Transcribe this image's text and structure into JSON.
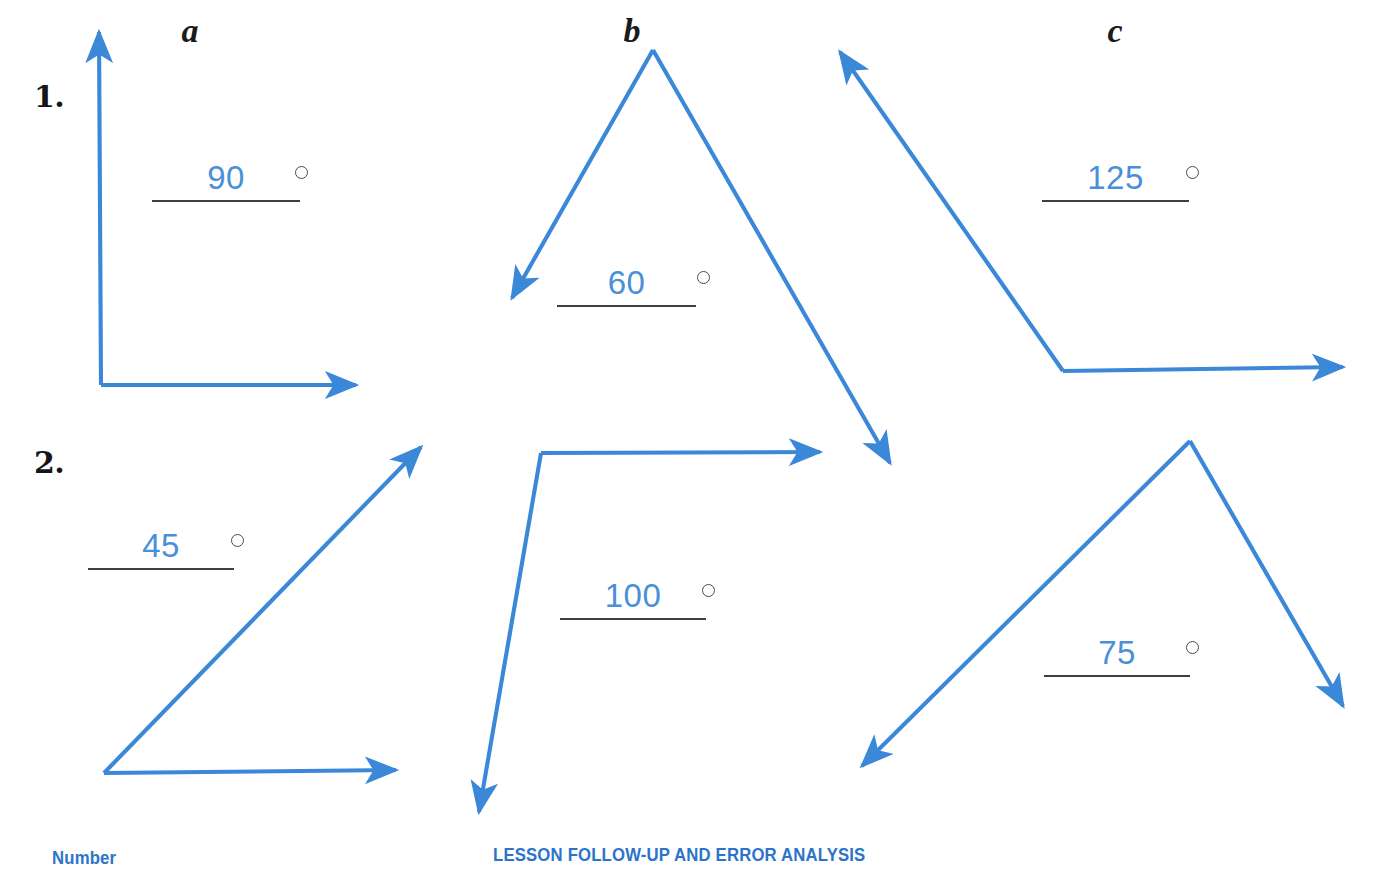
{
  "page": {
    "width": 1375,
    "height": 874,
    "background": "#ffffff",
    "ray_color": "#3b87d8",
    "value_color": "#4a90d9",
    "rule_color": "#3f3f3f",
    "footer_color": "#2c74c9"
  },
  "column_headers": [
    {
      "label": "a",
      "x": 160,
      "y": 14
    },
    {
      "label": "b",
      "x": 602,
      "y": 14
    },
    {
      "label": "c",
      "x": 1085,
      "y": 14
    }
  ],
  "row_numbers": [
    {
      "label": "1.",
      "x": 34,
      "y": 82
    },
    {
      "label": "2.",
      "x": 34,
      "y": 448
    }
  ],
  "answers": [
    {
      "id": "1a",
      "row": "1",
      "column": "a",
      "value": "90",
      "unit": "degree-symbol",
      "slot_x": 152,
      "slot_y": 160,
      "slot_w": 148,
      "degree_x": 295
    },
    {
      "id": "1b",
      "row": "1",
      "column": "b",
      "value": "60",
      "unit": "degree-symbol",
      "slot_x": 557,
      "slot_y": 265,
      "slot_w": 139,
      "degree_x": 697
    },
    {
      "id": "1c",
      "row": "1",
      "column": "c",
      "value": "125",
      "unit": "degree-symbol",
      "slot_x": 1042,
      "slot_y": 160,
      "slot_w": 147,
      "degree_x": 1186
    },
    {
      "id": "2a",
      "row": "2",
      "column": "a",
      "value": "45",
      "unit": "degree-symbol",
      "slot_x": 88,
      "slot_y": 528,
      "slot_w": 146,
      "degree_x": 231
    },
    {
      "id": "2b",
      "row": "2",
      "column": "b",
      "value": "100",
      "unit": "degree-symbol",
      "slot_x": 560,
      "slot_y": 578,
      "slot_w": 146,
      "degree_x": 702
    },
    {
      "id": "2c",
      "row": "2",
      "column": "c",
      "value": "75",
      "unit": "degree-symbol",
      "slot_x": 1044,
      "slot_y": 635,
      "slot_w": 146,
      "degree_x": 1186
    }
  ],
  "figures": [
    {
      "id": "angle-1a",
      "row": "1",
      "column": "a",
      "measure": 90,
      "kind": "right",
      "vertex": [
        101,
        385
      ],
      "rays": [
        {
          "name": "ray-up",
          "to": [
            99,
            32
          ]
        },
        {
          "name": "ray-right",
          "to": [
            356,
            385
          ]
        }
      ]
    },
    {
      "id": "angle-1b",
      "row": "1",
      "column": "b",
      "measure": 60,
      "kind": "acute",
      "vertex": [
        653,
        50
      ],
      "rays": [
        {
          "name": "ray-down-left",
          "to": [
            512,
            298
          ]
        },
        {
          "name": "ray-down-right",
          "to": [
            890,
            463
          ]
        }
      ]
    },
    {
      "id": "angle-1c",
      "row": "1",
      "column": "c",
      "measure": 125,
      "kind": "obtuse",
      "vertex": [
        1063,
        371
      ],
      "rays": [
        {
          "name": "ray-up-left",
          "to": [
            840,
            52
          ]
        },
        {
          "name": "ray-right",
          "to": [
            1343,
            367
          ]
        }
      ]
    },
    {
      "id": "angle-2a",
      "row": "2",
      "column": "a",
      "measure": 45,
      "kind": "acute",
      "vertex": [
        104,
        773
      ],
      "rays": [
        {
          "name": "ray-up-right",
          "to": [
            421,
            447
          ]
        },
        {
          "name": "ray-right",
          "to": [
            396,
            770
          ]
        }
      ]
    },
    {
      "id": "angle-2b",
      "row": "2",
      "column": "b",
      "measure": 100,
      "kind": "obtuse",
      "vertex": [
        541,
        453
      ],
      "rays": [
        {
          "name": "ray-right",
          "to": [
            820,
            452
          ]
        },
        {
          "name": "ray-down-left",
          "to": [
            479,
            812
          ]
        }
      ]
    },
    {
      "id": "angle-2c",
      "row": "2",
      "column": "c",
      "measure": 75,
      "kind": "acute",
      "vertex": [
        1190,
        441
      ],
      "rays": [
        {
          "name": "ray-down-left",
          "to": [
            862,
            766
          ]
        },
        {
          "name": "ray-down-right",
          "to": [
            1343,
            706
          ]
        }
      ]
    }
  ],
  "footer": {
    "left_label": "Number",
    "left_x": 52,
    "left_y": 848,
    "center_label": "LESSON FOLLOW-UP AND ERROR ANALYSIS",
    "center_x": 493,
    "center_y": 845
  }
}
